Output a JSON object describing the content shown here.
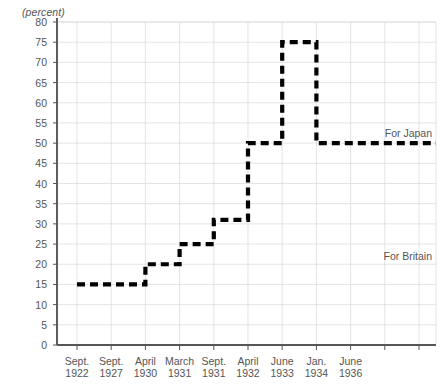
{
  "chart_data": {
    "type": "line",
    "subtype": "step",
    "title": "",
    "xlabel": "",
    "ylabel": "(percent)",
    "unit_label": "(percent)",
    "ylim": [
      0,
      80
    ],
    "ytick_step": 5,
    "yticks": [
      0,
      5,
      10,
      15,
      20,
      25,
      30,
      35,
      40,
      45,
      50,
      55,
      60,
      65,
      70,
      75,
      80
    ],
    "grid": true,
    "grid_color": "#d8d8d8",
    "legend_position": "inline-right",
    "line_color": "#000000",
    "line_style": "dashed",
    "categories": [
      "Sept. 1922",
      "Sept. 1927",
      "April 1930",
      "March 1931",
      "Sept. 1931",
      "April 1932",
      "June 1933",
      "Jan. 1934",
      "June 1936"
    ],
    "xtick_labels": [
      {
        "month": "Sept.",
        "year": "1922"
      },
      {
        "month": "Sept.",
        "year": "1927"
      },
      {
        "month": "April",
        "year": "1930"
      },
      {
        "month": "March",
        "year": "1931"
      },
      {
        "month": "Sept.",
        "year": "1931"
      },
      {
        "month": "April",
        "year": "1932"
      },
      {
        "month": "June",
        "year": "1933"
      },
      {
        "month": "Jan.",
        "year": "1934"
      },
      {
        "month": "June",
        "year": "1936"
      }
    ],
    "values": [
      15,
      15,
      20,
      25,
      31,
      50,
      75,
      50,
      50
    ],
    "series": [
      {
        "name": "For Japan",
        "values": [
          15,
          15,
          20,
          25,
          31,
          50,
          75,
          50,
          50
        ]
      }
    ],
    "annotations": [
      {
        "text": "For Japan",
        "value": 50,
        "position": "right-upper"
      },
      {
        "text": "For Britain",
        "value": 22,
        "position": "right-lower"
      }
    ]
  },
  "annotations": {
    "japan": "For Japan",
    "britain": "For Britain"
  }
}
